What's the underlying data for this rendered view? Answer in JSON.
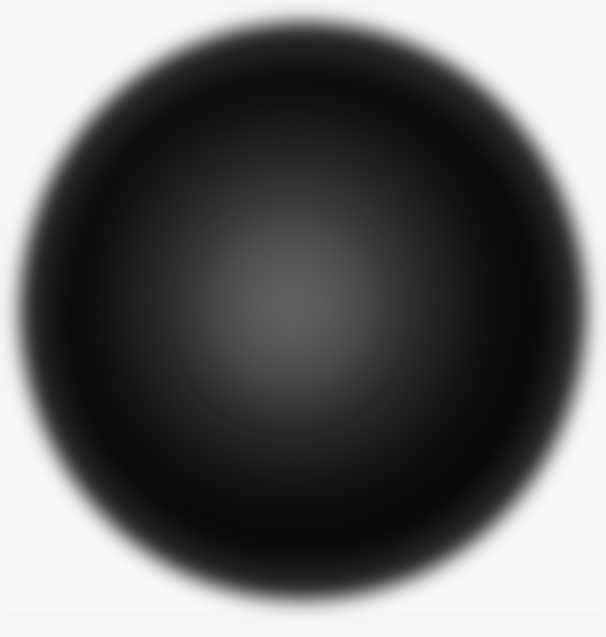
{
  "artwork": {
    "subject": "blurred dark sphere with lighter center",
    "background_color": "#f6f6f4",
    "sphere_color": "#050505",
    "core_color": "#5a5a5a"
  },
  "caption": {
    "text": ""
  }
}
